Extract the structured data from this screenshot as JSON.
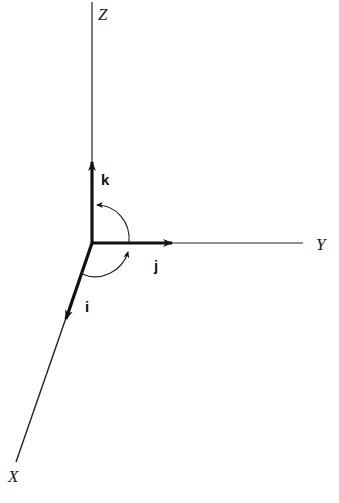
{
  "diagram": {
    "type": "3d-coordinate-axes",
    "colors": {
      "background": "#ffffff",
      "ink": "#111111"
    },
    "axes": [
      {
        "name": "Z",
        "label": "Z"
      },
      {
        "name": "Y",
        "label": "Y"
      },
      {
        "name": "X",
        "label": "X"
      }
    ],
    "unit_vectors": [
      {
        "name": "k",
        "label": "k",
        "along": "Z"
      },
      {
        "name": "j",
        "label": "j",
        "along": "Y"
      },
      {
        "name": "i",
        "label": "i",
        "along": "X"
      }
    ],
    "rotation_arcs": [
      {
        "from": "j",
        "to": "k"
      },
      {
        "from": "i",
        "to": "j"
      }
    ]
  }
}
